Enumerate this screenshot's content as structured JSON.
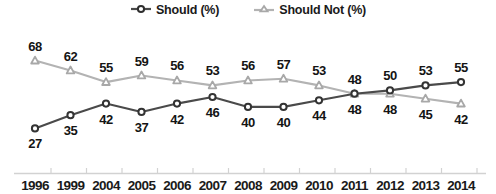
{
  "chart_data": {
    "type": "line",
    "title": "",
    "subtitle": "",
    "xlabel": "",
    "ylabel": "",
    "grid": false,
    "legend_position": "top-center",
    "ylim": [
      20,
      72
    ],
    "categories": [
      "1996",
      "1999",
      "2004",
      "2005",
      "2006",
      "2007",
      "2008",
      "2009",
      "2010",
      "2011",
      "2012",
      "2013",
      "2014"
    ],
    "series": [
      {
        "name": "Should (%)",
        "color": "#4a4a4a",
        "marker": "circle",
        "label_position": "below-then-above",
        "values": [
          27,
          35,
          42,
          37,
          42,
          46,
          40,
          40,
          44,
          48,
          50,
          53,
          55
        ]
      },
      {
        "name": "Should Not (%)",
        "color": "#b3b3b3",
        "marker": "triangle",
        "label_position": "above-then-below",
        "values": [
          68,
          62,
          55,
          59,
          56,
          53,
          56,
          57,
          53,
          48,
          48,
          45,
          42
        ]
      }
    ]
  },
  "legend": {
    "items": [
      {
        "label": "Should (%)",
        "key": "dark-circle-line-key"
      },
      {
        "label": "Should Not (%)",
        "key": "light-triangle-line-key"
      }
    ]
  },
  "axis": {
    "tick_labels": [
      "1996",
      "1999",
      "2004",
      "2005",
      "2006",
      "2007",
      "2008",
      "2009",
      "2010",
      "2011",
      "2012",
      "2013",
      "2014"
    ]
  }
}
